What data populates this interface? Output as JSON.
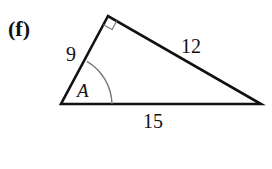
{
  "figure": {
    "part_label": "(f)",
    "triangle": {
      "vertices": {
        "top": [
          108,
          16
        ],
        "left": [
          61,
          104
        ],
        "right": [
          261,
          104
        ]
      },
      "sides": [
        {
          "label": "9",
          "between": [
            "left",
            "top"
          ]
        },
        {
          "label": "12",
          "between": [
            "top",
            "right"
          ]
        },
        {
          "label": "15",
          "between": [
            "left",
            "right"
          ]
        }
      ],
      "right_angle_at": "top",
      "angle_label": "A",
      "angle_at": "left"
    },
    "colors": {
      "stroke": "#111111",
      "arc": "#777777",
      "background": "#ffffff"
    }
  }
}
